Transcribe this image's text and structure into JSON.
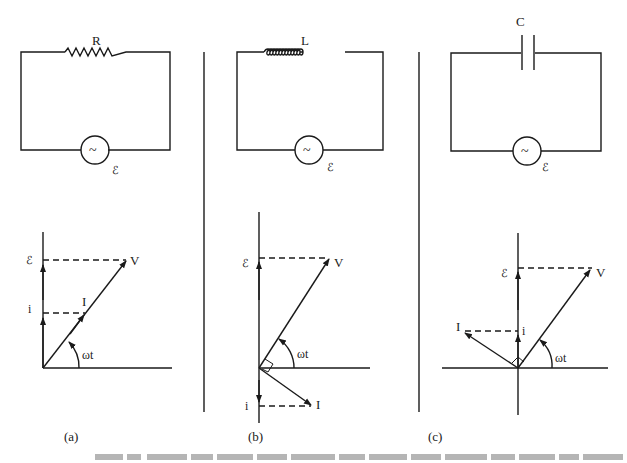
{
  "figure": {
    "panels": [
      {
        "id": "a",
        "label": "(a)",
        "component_label": "R",
        "source_label": "ℰ",
        "source_symbol": "~",
        "phasor": {
          "emf_label": "ℰ",
          "current_proj_label": "i",
          "voltage_label": "V",
          "current_label": "I",
          "angle_label": "ωt"
        }
      },
      {
        "id": "b",
        "label": "(b)",
        "component_label": "L",
        "source_label": "ℰ",
        "source_symbol": "~",
        "phasor": {
          "emf_label": "ℰ",
          "current_proj_label": "i",
          "voltage_label": "V",
          "current_label": "I",
          "angle_label": "ωt"
        }
      },
      {
        "id": "c",
        "label": "(c)",
        "component_label": "C",
        "source_label": "ℰ",
        "source_symbol": "~",
        "phasor": {
          "emf_label": "ℰ",
          "current_proj_label": "i",
          "voltage_label": "V",
          "current_label": "I",
          "angle_label": "ωt"
        }
      }
    ],
    "caption_truncated": true
  },
  "colors": {
    "ink": "#1a1a1a",
    "background": "#ffffff",
    "caption": "#9a9a9a"
  }
}
